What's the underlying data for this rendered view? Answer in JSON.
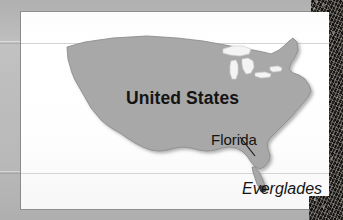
{
  "slide": {
    "background_color": "#ffffff",
    "surround_color": "#b9b9b9",
    "labels": {
      "country": "United States",
      "state": "Florida",
      "region": "Everglades"
    },
    "map": {
      "name": "united-states-outline",
      "fill_color": "#a8a8a8",
      "stroke_color": "#8f8f8f",
      "lakes_color": "#f2f2f2",
      "marker_color": "#4a4a4a",
      "marker_label": "Everglades",
      "leader_line_from": "Florida",
      "leader_line_to": "florida-peninsula"
    }
  }
}
